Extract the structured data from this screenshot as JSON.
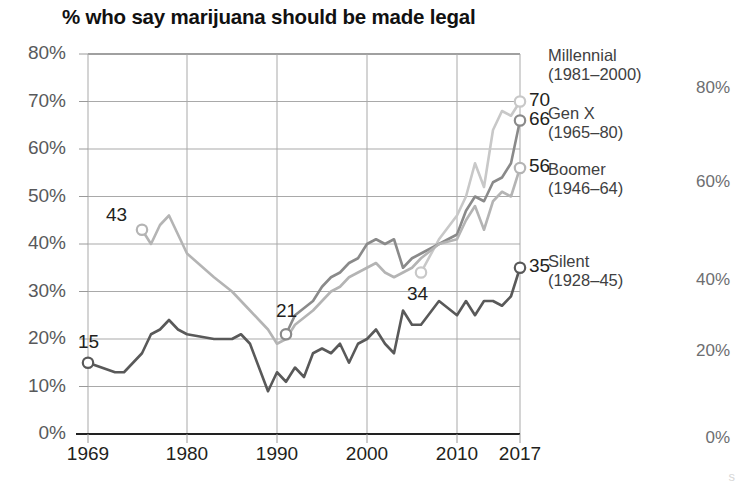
{
  "chart_data": {
    "type": "line",
    "title": "% who say marijuana should be made legal",
    "xlabel": "",
    "ylabel": "",
    "xlim": [
      1969,
      2017
    ],
    "ylim": [
      0,
      80
    ],
    "grid": true,
    "legend_position": "right",
    "x_tick_labels": [
      "1969",
      "1980",
      "1990",
      "2000",
      "2010",
      "2017"
    ],
    "x_tick_values": [
      1969,
      1980,
      1990,
      2000,
      2010,
      2017
    ],
    "y_tick_labels": [
      "0%",
      "10%",
      "20%",
      "30%",
      "40%",
      "50%",
      "60%",
      "70%",
      "80%"
    ],
    "y_tick_values": [
      0,
      10,
      20,
      30,
      40,
      50,
      60,
      70,
      80
    ],
    "right_axis_tick_labels": [
      "0%",
      "20%",
      "40%",
      "60%",
      "80%"
    ],
    "right_axis_tick_values": [
      0,
      20,
      40,
      60,
      80
    ],
    "series": [
      {
        "name": "Millennial",
        "generation_years": "(1981–2000)",
        "color": "#c8c8c8",
        "start_label": "34",
        "end_label": "70",
        "x": [
          2006,
          2008,
          2010,
          2011,
          2012,
          2013,
          2014,
          2015,
          2016,
          2017
        ],
        "values": [
          34,
          41,
          46,
          50,
          57,
          52,
          64,
          68,
          67,
          70
        ]
      },
      {
        "name": "Gen X",
        "generation_years": "(1965–80)",
        "color": "#8a8a8a",
        "start_label": "21",
        "end_label": "66",
        "x": [
          1991,
          1992,
          1994,
          1995,
          1996,
          1997,
          1998,
          1999,
          2000,
          2001,
          2002,
          2003,
          2004,
          2005,
          2006,
          2008,
          2010,
          2011,
          2012,
          2013,
          2014,
          2015,
          2016,
          2017
        ],
        "values": [
          21,
          25,
          28,
          31,
          33,
          34,
          36,
          37,
          40,
          41,
          40,
          41,
          35,
          37,
          38,
          40,
          42,
          47,
          50,
          49,
          53,
          54,
          57,
          66
        ]
      },
      {
        "name": "Boomer",
        "generation_years": "(1946–64)",
        "color": "#b4b4b4",
        "start_label": "43",
        "end_label": "56",
        "x": [
          1975,
          1976,
          1977,
          1978,
          1979,
          1980,
          1983,
          1985,
          1986,
          1987,
          1988,
          1989,
          1990,
          1991,
          1992,
          1994,
          1995,
          1996,
          1997,
          1998,
          1999,
          2000,
          2001,
          2002,
          2003,
          2004,
          2005,
          2006,
          2008,
          2010,
          2011,
          2012,
          2013,
          2014,
          2015,
          2016,
          2017
        ],
        "values": [
          43,
          40,
          44,
          46,
          42,
          38,
          33,
          30,
          28,
          26,
          24,
          22,
          19,
          20,
          23,
          26,
          28,
          30,
          31,
          33,
          34,
          35,
          36,
          34,
          33,
          34,
          35,
          37,
          40,
          41,
          45,
          48,
          43,
          49,
          51,
          50,
          56
        ]
      },
      {
        "name": "Silent",
        "generation_years": "(1928–45)",
        "color": "#595959",
        "start_label": "15",
        "end_label": "35",
        "x": [
          1969,
          1972,
          1973,
          1975,
          1976,
          1977,
          1978,
          1979,
          1980,
          1983,
          1985,
          1986,
          1987,
          1988,
          1989,
          1990,
          1991,
          1992,
          1993,
          1994,
          1995,
          1996,
          1997,
          1998,
          1999,
          2000,
          2001,
          2002,
          2003,
          2004,
          2005,
          2006,
          2008,
          2010,
          2011,
          2012,
          2013,
          2014,
          2015,
          2016,
          2017
        ],
        "values": [
          15,
          13,
          13,
          17,
          21,
          22,
          24,
          22,
          21,
          20,
          20,
          21,
          19,
          14,
          9,
          13,
          11,
          14,
          12,
          17,
          18,
          17,
          19,
          15,
          19,
          20,
          22,
          19,
          17,
          26,
          23,
          23,
          28,
          25,
          28,
          25,
          28,
          28,
          27,
          29,
          35
        ]
      }
    ]
  },
  "legend": [
    {
      "name": "Millennial",
      "years": "(1981–2000)"
    },
    {
      "name": "Gen X",
      "years": "(1965–80)"
    },
    {
      "name": "Boomer",
      "years": "(1946–64)"
    },
    {
      "name": "Silent",
      "years": "(1928–45)"
    }
  ],
  "end_labels": [
    "70",
    "66",
    "56",
    "35"
  ],
  "point_labels": [
    "43",
    "15",
    "21",
    "34"
  ],
  "right_axis": [
    "80%",
    "60%",
    "40%",
    "20%",
    "0%"
  ],
  "corner": {
    "mark": "s"
  }
}
